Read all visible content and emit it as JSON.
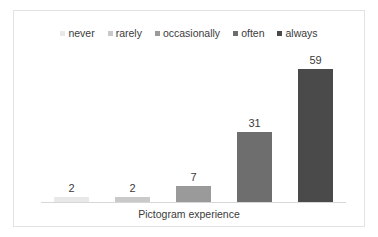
{
  "chart_data": {
    "type": "bar",
    "title": "",
    "subtitle": "",
    "xlabel": "Pictogram experience",
    "ylabel": "",
    "categories": [
      "never",
      "rarely",
      "occasionally",
      "often",
      "always"
    ],
    "values": [
      2,
      2,
      7,
      31,
      59
    ],
    "value_labels": [
      "2",
      "2",
      "7",
      "31",
      "59"
    ],
    "series": [
      {
        "name": "Pictogram experience",
        "values": [
          2,
          2,
          7,
          31,
          59
        ]
      }
    ],
    "ylim": [
      0,
      66
    ],
    "grid": false,
    "legend_position": "top-center",
    "legend": [
      {
        "label": "never",
        "color": "#e8e8e8"
      },
      {
        "label": "rarely",
        "color": "#c9c9c9"
      },
      {
        "label": "occasionally",
        "color": "#9a9a9a"
      },
      {
        "label": "often",
        "color": "#6e6e6e"
      },
      {
        "label": "always",
        "color": "#4a4a4a"
      }
    ],
    "colors": [
      "#e8e8e8",
      "#c9c9c9",
      "#9a9a9a",
      "#6e6e6e",
      "#4a4a4a"
    ],
    "axis_line_color": "#d7d7d7",
    "plot_border_color": "#e3e3e3",
    "text_color": "#3b3b3b",
    "background_color": "#ffffff"
  }
}
